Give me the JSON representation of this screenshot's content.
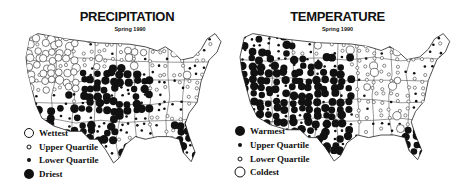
{
  "figure": {
    "panels": [
      {
        "title": "PRECIPITATION",
        "subtitle": "Spring 1990",
        "legend": [
          {
            "label": "Wettest",
            "symbol": "large-open-circle"
          },
          {
            "label": "Upper Quartile",
            "symbol": "small-open-circle"
          },
          {
            "label": "Lower Quartile",
            "symbol": "small-filled-circle"
          },
          {
            "label": "Driest",
            "symbol": "large-filled-circle"
          }
        ]
      },
      {
        "title": "TEMPERATURE",
        "subtitle": "Spring 1990",
        "legend": [
          {
            "label": "Warmest",
            "symbol": "large-filled-circle"
          },
          {
            "label": "Upper Quartile",
            "symbol": "small-filled-circle"
          },
          {
            "label": "Lower Quartile",
            "symbol": "small-open-circle"
          },
          {
            "label": "Coldest",
            "symbol": "large-open-circle"
          }
        ]
      }
    ],
    "colors": {
      "ink": "#111111",
      "paper": "#ffffff"
    }
  },
  "maps": {
    "precipitation": {
      "regions": {
        "northwest_wet": "large-open-circle",
        "northern_plains": "small-open-circle",
        "central_plains": "large-filled-circle",
        "southwest": "large-filled-circle",
        "east": "small-open-circle",
        "southeast_florida": "large-filled-circle"
      }
    },
    "temperature": {
      "regions": {
        "west_southwest": "large-filled-circle",
        "southern_plains": "large-filled-circle",
        "northern_plains": "small-open-circle",
        "midwest_east": "small-open-circle",
        "florida": "large-filled-circle",
        "northeast_coast": "small-filled-circle"
      }
    }
  }
}
